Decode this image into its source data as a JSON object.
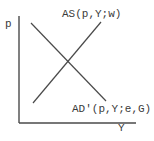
{
  "diagram": {
    "type": "supply-demand-cross",
    "axes": {
      "y_label": "p",
      "x_label": "Y"
    },
    "curves": [
      {
        "id": "as",
        "label": "AS(p,Y;w)",
        "direction": "upward-sloping"
      },
      {
        "id": "ad",
        "label": "AD'(p,Y;e,G)",
        "direction": "downward-sloping"
      }
    ],
    "colors": {
      "line": "#4a4a4a",
      "text": "#3a3a3a",
      "background": "#ffffff"
    }
  }
}
